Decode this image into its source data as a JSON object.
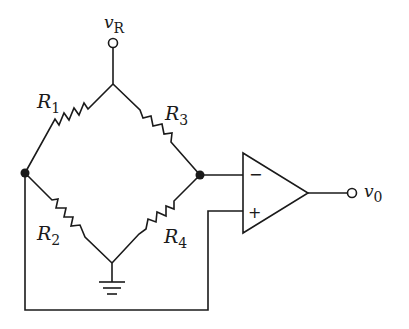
{
  "diagram": {
    "type": "circuit",
    "source": {
      "symbol": "v",
      "subscript": "R"
    },
    "output": {
      "symbol": "v",
      "subscript": "0"
    },
    "resistors": [
      {
        "symbol": "R",
        "subscript": "1",
        "position": "upper-left"
      },
      {
        "symbol": "R",
        "subscript": "3",
        "position": "upper-right"
      },
      {
        "symbol": "R",
        "subscript": "2",
        "position": "lower-left"
      },
      {
        "symbol": "R",
        "subscript": "4",
        "position": "lower-right"
      }
    ],
    "opamp": {
      "inverting_sign": "−",
      "noninverting_sign": "+"
    },
    "ground": "ground-symbol"
  }
}
